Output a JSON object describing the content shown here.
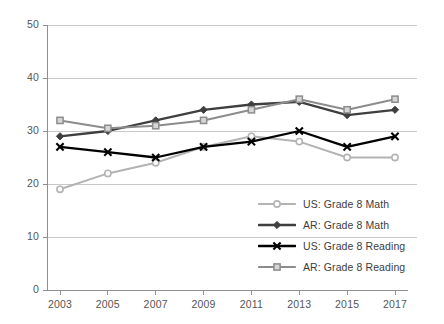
{
  "chart_data": {
    "type": "line",
    "title": "",
    "subtitle": "",
    "xlabel": "",
    "ylabel": "",
    "categories": [
      "2003",
      "2005",
      "2007",
      "2009",
      "2011",
      "2013",
      "2015",
      "2017"
    ],
    "x": [
      2003,
      2005,
      2007,
      2009,
      2011,
      2013,
      2015,
      2017
    ],
    "ylim": [
      0,
      50
    ],
    "yticks": [
      0,
      10,
      20,
      30,
      40,
      50
    ],
    "ytick_labels": [
      "0",
      "10",
      "20",
      "30",
      "40",
      "50"
    ],
    "grid": true,
    "grid_axis": "y",
    "legend_position": "inside-lower-right",
    "series": [
      {
        "name": "US: Grade 8 Math",
        "values": [
          19,
          22,
          24,
          27,
          29,
          28,
          25,
          25
        ],
        "color": "#b3b3b3",
        "marker": "circle"
      },
      {
        "name": "AR: Grade 8 Math",
        "values": [
          29,
          30,
          32,
          34,
          35,
          35.5,
          33,
          34
        ],
        "color": "#3f3f3f",
        "marker": "diamond"
      },
      {
        "name": "US: Grade 8 Reading",
        "values": [
          27,
          26,
          25,
          27,
          28,
          30,
          27,
          29
        ],
        "color": "#000000",
        "marker": "x"
      },
      {
        "name": "AR: Grade 8 Reading",
        "values": [
          32,
          30.5,
          31,
          32,
          34,
          36,
          34,
          36
        ],
        "color": "#8c8c8c",
        "marker": "square"
      }
    ]
  },
  "legend": {
    "items": [
      {
        "label": "US: Grade 8 Math"
      },
      {
        "label": "AR: Grade 8 Math"
      },
      {
        "label": "US: Grade 8 Reading"
      },
      {
        "label": "AR: Grade 8 Reading"
      }
    ]
  },
  "axes": {
    "y_tick_labels": [
      "50",
      "40",
      "30",
      "20",
      "10",
      "0"
    ],
    "x_tick_labels": [
      "2003",
      "2005",
      "2007",
      "2009",
      "2011",
      "2013",
      "2015",
      "2017"
    ]
  },
  "colors": {
    "grid": "#c9c9c9",
    "axis": "#8f8f8f",
    "background": "#ffffff",
    "text": "#555555"
  }
}
